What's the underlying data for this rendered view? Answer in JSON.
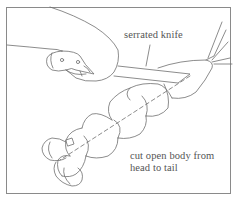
{
  "illustration": {
    "subject": "hand cutting lobster with knife",
    "labels": {
      "knife": "serrated knife",
      "instruction_line1": "cut open body from",
      "instruction_line2": "head to tail"
    },
    "colors": {
      "line": "#6e6e6e",
      "text": "#555555",
      "frame": "#8a8a8a",
      "background": "#ffffff"
    }
  }
}
